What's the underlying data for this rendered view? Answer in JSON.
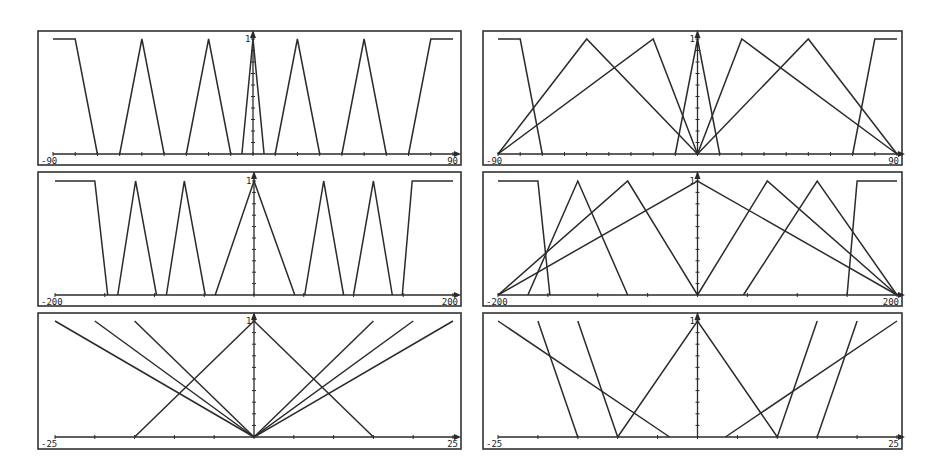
{
  "figure": {
    "title": "",
    "background": "#ffffff",
    "line_color": "#2b2b2b"
  },
  "chart_data": [
    {
      "id": "top-left",
      "type": "line",
      "title": "",
      "xlabel": "",
      "ylabel": "",
      "x_range": [
        -90,
        90
      ],
      "y_range": [
        0,
        1
      ],
      "x_tick_labels": [
        "-90",
        "90"
      ],
      "y_tick_labels": [
        "1"
      ],
      "x_tick_step": 10,
      "grid": false,
      "frame": {
        "x": 38,
        "y": 31,
        "w": 423,
        "h": 134
      },
      "axis": {
        "x0": 53,
        "x1": 453,
        "y_base": 154,
        "y_top": 39,
        "x_center": 253
      },
      "series": [
        {
          "name": "NB",
          "points": [
            [
              -90,
              1
            ],
            [
              -80,
              1
            ],
            [
              -70,
              0
            ]
          ]
        },
        {
          "name": "NM",
          "points": [
            [
              -60,
              0
            ],
            [
              -50,
              1
            ],
            [
              -40,
              0
            ]
          ]
        },
        {
          "name": "NS",
          "points": [
            [
              -30,
              0
            ],
            [
              -20,
              1
            ],
            [
              -10,
              0
            ]
          ]
        },
        {
          "name": "ZE",
          "points": [
            [
              -5,
              0
            ],
            [
              0,
              1
            ],
            [
              5,
              0
            ]
          ]
        },
        {
          "name": "PS",
          "points": [
            [
              10,
              0
            ],
            [
              20,
              1
            ],
            [
              30,
              0
            ]
          ]
        },
        {
          "name": "PM",
          "points": [
            [
              40,
              0
            ],
            [
              50,
              1
            ],
            [
              60,
              0
            ]
          ]
        },
        {
          "name": "PB",
          "points": [
            [
              70,
              0
            ],
            [
              80,
              1
            ],
            [
              90,
              1
            ]
          ]
        }
      ]
    },
    {
      "id": "top-right",
      "type": "line",
      "title": "",
      "xlabel": "",
      "ylabel": "",
      "x_range": [
        -90,
        90
      ],
      "y_range": [
        0,
        1
      ],
      "x_tick_labels": [
        "-90",
        "90"
      ],
      "y_tick_labels": [
        "1"
      ],
      "x_tick_step": 10,
      "grid": false,
      "frame": {
        "x": 483,
        "y": 31,
        "w": 419,
        "h": 134
      },
      "axis": {
        "x0": 498,
        "x1": 897,
        "y_base": 154,
        "y_top": 39,
        "x_center": 697
      },
      "series": [
        {
          "name": "NB",
          "points": [
            [
              -90,
              1
            ],
            [
              -80,
              1
            ],
            [
              -70,
              0
            ]
          ]
        },
        {
          "name": "NM",
          "points": [
            [
              -90,
              0
            ],
            [
              -50,
              1
            ],
            [
              0,
              0
            ]
          ]
        },
        {
          "name": "NS",
          "points": [
            [
              -90,
              0
            ],
            [
              -20,
              1
            ],
            [
              0,
              0
            ]
          ]
        },
        {
          "name": "ZE",
          "points": [
            [
              -10,
              0
            ],
            [
              0,
              1
            ],
            [
              10,
              0
            ]
          ]
        },
        {
          "name": "PS",
          "points": [
            [
              0,
              0
            ],
            [
              20,
              1
            ],
            [
              90,
              0
            ]
          ]
        },
        {
          "name": "PM",
          "points": [
            [
              0,
              0
            ],
            [
              50,
              1
            ],
            [
              90,
              0
            ]
          ]
        },
        {
          "name": "PB",
          "points": [
            [
              70,
              0
            ],
            [
              80,
              1
            ],
            [
              90,
              1
            ]
          ]
        }
      ]
    },
    {
      "id": "middle-left",
      "type": "line",
      "title": "",
      "xlabel": "",
      "ylabel": "",
      "x_range": [
        -200,
        200
      ],
      "y_range": [
        0,
        1
      ],
      "x_tick_labels": [
        "-200",
        "200"
      ],
      "y_tick_labels": [
        "1"
      ],
      "x_tick_step": 50,
      "grid": false,
      "frame": {
        "x": 38,
        "y": 172,
        "w": 423,
        "h": 134
      },
      "axis": {
        "x0": 55,
        "x1": 453,
        "y_base": 295,
        "y_top": 181,
        "x_center": 254
      },
      "series": [
        {
          "name": "NB",
          "points": [
            [
              -200,
              1
            ],
            [
              -160,
              1
            ],
            [
              -147,
              0
            ]
          ]
        },
        {
          "name": "NM",
          "points": [
            [
              -137,
              0
            ],
            [
              -119,
              1
            ],
            [
              -98,
              0
            ]
          ]
        },
        {
          "name": "NS",
          "points": [
            [
              -88,
              0
            ],
            [
              -70,
              1
            ],
            [
              -49,
              0
            ]
          ]
        },
        {
          "name": "ZE",
          "points": [
            [
              -39,
              0
            ],
            [
              0,
              1
            ],
            [
              41,
              0
            ]
          ]
        },
        {
          "name": "PS",
          "points": [
            [
              51,
              0
            ],
            [
              70,
              1
            ],
            [
              90,
              0
            ]
          ]
        },
        {
          "name": "PM",
          "points": [
            [
              100,
              0
            ],
            [
              120,
              1
            ],
            [
              139,
              0
            ]
          ]
        },
        {
          "name": "PB",
          "points": [
            [
              149,
              0
            ],
            [
              159,
              1
            ],
            [
              200,
              1
            ]
          ]
        }
      ]
    },
    {
      "id": "middle-right",
      "type": "line",
      "title": "",
      "xlabel": "",
      "ylabel": "",
      "x_range": [
        -200,
        200
      ],
      "y_range": [
        0,
        1
      ],
      "x_tick_labels": [
        "-200",
        "200"
      ],
      "y_tick_labels": [
        "1"
      ],
      "x_tick_step": 50,
      "grid": false,
      "frame": {
        "x": 483,
        "y": 172,
        "w": 419,
        "h": 134
      },
      "axis": {
        "x0": 498,
        "x1": 897,
        "y_base": 295,
        "y_top": 181,
        "x_center": 697
      },
      "series": [
        {
          "name": "NB",
          "points": [
            [
              -200,
              1
            ],
            [
              -160,
              1
            ],
            [
              -148,
              0
            ]
          ]
        },
        {
          "name": "NM",
          "points": [
            [
              -170,
              0
            ],
            [
              -120,
              1
            ],
            [
              -70,
              0
            ]
          ]
        },
        {
          "name": "NS",
          "points": [
            [
              -200,
              0
            ],
            [
              -70,
              1
            ],
            [
              0,
              0
            ]
          ]
        },
        {
          "name": "ZE",
          "points": [
            [
              -200,
              0
            ],
            [
              0,
              1
            ],
            [
              200,
              0
            ]
          ]
        },
        {
          "name": "PS",
          "points": [
            [
              0,
              0
            ],
            [
              70,
              1
            ],
            [
              200,
              0
            ]
          ]
        },
        {
          "name": "PM",
          "points": [
            [
              46,
              0
            ],
            [
              120,
              1
            ],
            [
              200,
              0
            ]
          ]
        },
        {
          "name": "PB",
          "points": [
            [
              150,
              0
            ],
            [
              160,
              1
            ],
            [
              200,
              1
            ]
          ]
        }
      ]
    },
    {
      "id": "bottom-left",
      "type": "line",
      "title": "",
      "xlabel": "",
      "ylabel": "",
      "x_range": [
        -25,
        25
      ],
      "y_range": [
        0,
        1
      ],
      "x_tick_labels": [
        "-25",
        "25"
      ],
      "y_tick_labels": [
        "1"
      ],
      "x_tick_step": 5,
      "grid": false,
      "frame": {
        "x": 38,
        "y": 313,
        "w": 423,
        "h": 136
      },
      "axis": {
        "x0": 55,
        "x1": 453,
        "y_base": 437,
        "y_top": 321,
        "x_center": 254
      },
      "series": [
        {
          "name": "NB",
          "points": [
            [
              -25,
              1
            ],
            [
              0,
              0
            ]
          ]
        },
        {
          "name": "NM",
          "points": [
            [
              -20,
              1
            ],
            [
              0,
              0
            ]
          ]
        },
        {
          "name": "NS",
          "points": [
            [
              -15,
              1
            ],
            [
              0,
              0
            ]
          ]
        },
        {
          "name": "ZE",
          "points": [
            [
              -15,
              0
            ],
            [
              0,
              1
            ],
            [
              15,
              0
            ]
          ]
        },
        {
          "name": "PS",
          "points": [
            [
              0,
              0
            ],
            [
              15,
              1
            ]
          ]
        },
        {
          "name": "PM",
          "points": [
            [
              0,
              0
            ],
            [
              20,
              1
            ]
          ]
        },
        {
          "name": "PB",
          "points": [
            [
              0,
              0
            ],
            [
              25,
              1
            ]
          ]
        }
      ]
    },
    {
      "id": "bottom-right",
      "type": "line",
      "title": "",
      "xlabel": "",
      "ylabel": "",
      "x_range": [
        -25,
        25
      ],
      "y_range": [
        0,
        1
      ],
      "x_tick_labels": [
        "-25",
        "25"
      ],
      "y_tick_labels": [
        "1"
      ],
      "x_tick_step": 5,
      "grid": false,
      "frame": {
        "x": 483,
        "y": 313,
        "w": 419,
        "h": 136
      },
      "axis": {
        "x0": 498,
        "x1": 897,
        "y_base": 437,
        "y_top": 321,
        "x_center": 697
      },
      "series": [
        {
          "name": "NB",
          "points": [
            [
              -25,
              1
            ],
            [
              -3.5,
              0
            ]
          ]
        },
        {
          "name": "NM",
          "points": [
            [
              -20,
              1
            ],
            [
              -15,
              0
            ]
          ]
        },
        {
          "name": "NS",
          "points": [
            [
              -15,
              1
            ],
            [
              -10,
              0
            ]
          ]
        },
        {
          "name": "ZE-left",
          "points": [
            [
              -10,
              0
            ],
            [
              0,
              1
            ],
            [
              10,
              0
            ]
          ]
        },
        {
          "name": "PS",
          "points": [
            [
              10,
              0
            ],
            [
              15,
              1
            ]
          ]
        },
        {
          "name": "PM",
          "points": [
            [
              15,
              0
            ],
            [
              20,
              1
            ]
          ]
        },
        {
          "name": "PB",
          "points": [
            [
              3.5,
              0
            ],
            [
              25,
              1
            ]
          ]
        }
      ]
    }
  ]
}
